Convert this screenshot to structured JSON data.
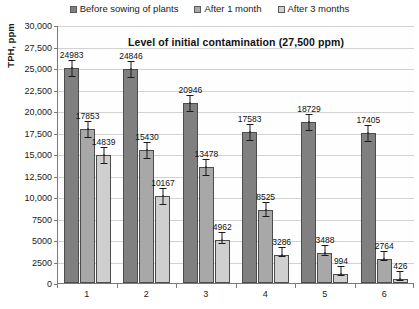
{
  "chart_data": {
    "type": "bar",
    "title": "Level of initial contamination (27,500 ppm)",
    "xlabel": "",
    "ylabel": "TPH, ppm",
    "ylim": [
      0,
      30000
    ],
    "ytick_labels": [
      "30,000",
      "27,500",
      "25,000",
      "22,500",
      "20,000",
      "17,500",
      "15,000",
      "12,500",
      "10,000",
      "7500",
      "5000",
      "2500",
      "0"
    ],
    "ytick_values": [
      30000,
      27500,
      25000,
      22500,
      20000,
      17500,
      15000,
      12500,
      10000,
      7500,
      5000,
      2500,
      0
    ],
    "grid": true,
    "legend_position": "top",
    "categories": [
      "1",
      "2",
      "3",
      "4",
      "5",
      "6"
    ],
    "series": [
      {
        "name": "Before sowing of plants",
        "color": "#808080",
        "values": [
          24983,
          24846,
          20946,
          17583,
          18729,
          17405
        ],
        "labels": [
          "24983",
          "24846",
          "20946",
          "17583",
          "18729",
          "17405"
        ]
      },
      {
        "name": "After 1 month",
        "color": "#a8a8a8",
        "values": [
          17853,
          15430,
          13478,
          8525,
          3488,
          2764
        ],
        "labels": [
          "17853",
          "15430",
          "13478",
          "8525",
          "3488",
          "2764"
        ]
      },
      {
        "name": "After 3 months",
        "color": "#cfcfcf",
        "values": [
          14839,
          10167,
          4962,
          3286,
          994,
          426
        ],
        "labels": [
          "14839",
          "10167",
          "4962",
          "3286",
          "994",
          "426"
        ]
      }
    ]
  }
}
